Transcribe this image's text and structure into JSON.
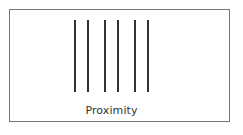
{
  "diagram": {
    "caption": "Proximity",
    "line_color": "#333333",
    "border_color": "#777777",
    "lines": [
      {
        "x": 74
      },
      {
        "x": 87
      },
      {
        "x": 104
      },
      {
        "x": 117
      },
      {
        "x": 134
      },
      {
        "x": 147
      }
    ]
  }
}
